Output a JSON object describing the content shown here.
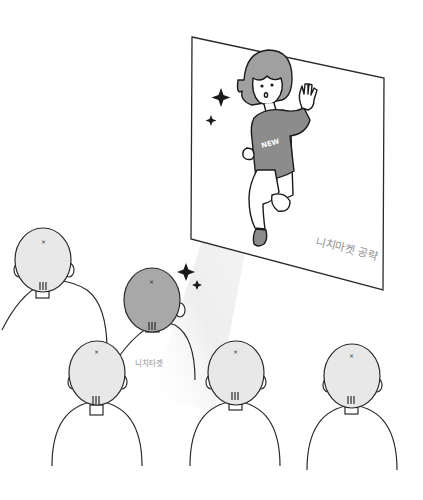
{
  "illustration": {
    "panel": {
      "caption": "니치마켓 공략",
      "shirt_text": "NEW"
    },
    "audience": {
      "highlighted_label": "니치타겟",
      "count": 5
    },
    "colors": {
      "line": "#2a2a2a",
      "head_fill": "#e8e8e8",
      "highlight_head_fill": "#a8a8a8",
      "shirt_fill": "#8c8c8c",
      "hair_fill": "#a0a0a0",
      "beam": "#f2f2f2"
    }
  }
}
